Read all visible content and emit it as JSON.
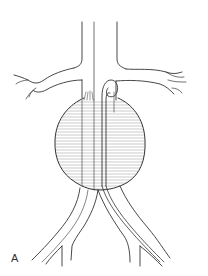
{
  "figure": {
    "panel_label": "A",
    "line_color": "#333333",
    "hatch_color": "#8a8a8a",
    "background": "#ffffff"
  }
}
